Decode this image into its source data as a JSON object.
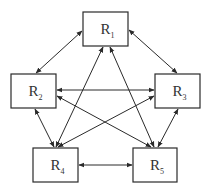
{
  "diagram": {
    "type": "directed-graph",
    "nodes": [
      {
        "id": "R1",
        "base": "R",
        "sub": "1"
      },
      {
        "id": "R2",
        "base": "R",
        "sub": "2"
      },
      {
        "id": "R3",
        "base": "R",
        "sub": "3"
      },
      {
        "id": "R4",
        "base": "R",
        "sub": "4"
      },
      {
        "id": "R5",
        "base": "R",
        "sub": "5"
      }
    ],
    "edges": [
      {
        "from": "R1",
        "to": "R2",
        "bidirectional": true
      },
      {
        "from": "R1",
        "to": "R3",
        "bidirectional": true
      },
      {
        "from": "R1",
        "to": "R4",
        "bidirectional": true
      },
      {
        "from": "R1",
        "to": "R5",
        "bidirectional": true
      },
      {
        "from": "R2",
        "to": "R3",
        "bidirectional": true
      },
      {
        "from": "R2",
        "to": "R4",
        "bidirectional": true
      },
      {
        "from": "R2",
        "to": "R5",
        "bidirectional": true
      },
      {
        "from": "R3",
        "to": "R4",
        "bidirectional": true
      },
      {
        "from": "R3",
        "to": "R5",
        "bidirectional": true
      },
      {
        "from": "R4",
        "to": "R5",
        "bidirectional": true
      }
    ],
    "colors": {
      "stroke": "#2a2a2a",
      "text": "#333333",
      "background": "#ffffff"
    }
  }
}
